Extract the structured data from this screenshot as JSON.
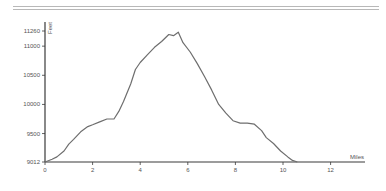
{
  "chart_data": {
    "type": "line",
    "title": "",
    "xlabel": "Miles",
    "ylabel": "Feet",
    "xlim": [
      0,
      13.2
    ],
    "ylim": [
      9012,
      11260
    ],
    "x_ticks": [
      "0",
      "2",
      "4",
      "6",
      "8",
      "10",
      "12"
    ],
    "y_ticks": [
      "9012",
      "9500",
      "10000",
      "10500",
      "11000",
      "11260"
    ],
    "grid": false,
    "legend": null,
    "series": [
      {
        "name": "Elevation",
        "x": [
          0,
          0.3,
          0.5,
          0.8,
          1.0,
          1.2,
          1.5,
          1.8,
          2.0,
          2.3,
          2.6,
          2.9,
          3.1,
          3.3,
          3.6,
          3.8,
          4.0,
          4.3,
          4.6,
          4.9,
          5.2,
          5.4,
          5.6,
          5.8,
          6.1,
          6.4,
          6.7,
          7.0,
          7.3,
          7.6,
          7.9,
          8.2,
          8.5,
          8.8,
          9.1,
          9.3,
          9.6,
          9.9,
          10.2,
          10.4,
          10.6
        ],
        "values": [
          9012,
          9060,
          9100,
          9200,
          9320,
          9400,
          9530,
          9620,
          9650,
          9700,
          9750,
          9750,
          9880,
          10050,
          10350,
          10600,
          10720,
          10850,
          10980,
          11080,
          11200,
          11180,
          11240,
          11060,
          10900,
          10700,
          10480,
          10250,
          10000,
          9850,
          9720,
          9680,
          9680,
          9660,
          9550,
          9430,
          9330,
          9200,
          9100,
          9040,
          9012
        ]
      }
    ]
  }
}
